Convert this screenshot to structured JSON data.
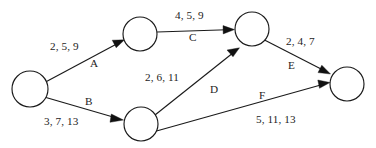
{
  "diagram": {
    "type": "activity-network-diagram",
    "title": "",
    "background_color": "#ffffff",
    "stroke_color": "#1a1a1a",
    "text_color": "#1c1c1c",
    "nodes": [
      {
        "id": "n1",
        "label": "",
        "cx": 30,
        "cy": 89,
        "r": 18
      },
      {
        "id": "n2",
        "label": "",
        "cx": 140,
        "cy": 34,
        "r": 17
      },
      {
        "id": "n3",
        "label": "",
        "cx": 252,
        "cy": 29,
        "r": 17
      },
      {
        "id": "n4",
        "label": "",
        "cx": 141,
        "cy": 124,
        "r": 17
      },
      {
        "id": "n5",
        "label": "",
        "cx": 347,
        "cy": 84,
        "r": 17
      }
    ],
    "edges": [
      {
        "id": "A",
        "name": "A",
        "from": "n1",
        "to": "n2",
        "weights": "2, 5, 9",
        "weights_values": [
          2,
          5,
          9
        ]
      },
      {
        "id": "B",
        "name": "B",
        "from": "n1",
        "to": "n4",
        "weights": "3, 7, 13",
        "weights_values": [
          3,
          7,
          13
        ]
      },
      {
        "id": "C",
        "name": "C",
        "from": "n2",
        "to": "n3",
        "weights": "4, 5, 9",
        "weights_values": [
          4,
          5,
          9
        ]
      },
      {
        "id": "D",
        "name": "D",
        "from": "n4",
        "to": "n3",
        "weights": "2, 6, 11",
        "weights_values": [
          2,
          6,
          11
        ]
      },
      {
        "id": "E",
        "name": "E",
        "from": "n3",
        "to": "n5",
        "weights": "2, 4, 7",
        "weights_values": [
          2,
          4,
          7
        ]
      },
      {
        "id": "F",
        "name": "F",
        "from": "n4",
        "to": "n5",
        "weights": "5, 11, 13",
        "weights_values": [
          5,
          11,
          13
        ]
      }
    ],
    "labels": {
      "edge_A_weights": "2, 5, 9",
      "edge_A_name": "A",
      "edge_B_weights": "3, 7, 13",
      "edge_B_name": "B",
      "edge_C_weights": "4, 5, 9",
      "edge_C_name": "C",
      "edge_D_weights": "2, 6, 11",
      "edge_D_name": "D",
      "edge_E_weights": "2, 4, 7",
      "edge_E_name": "E",
      "edge_F_weights": "5, 11, 13",
      "edge_F_name": "F"
    }
  }
}
